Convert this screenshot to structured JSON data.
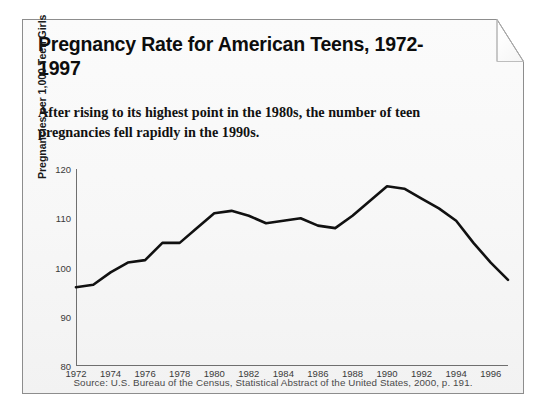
{
  "card": {
    "title": "Pregnancy Rate for American Teens, 1972-1997",
    "subtitle": "After rising to its highest point in the 1980s, the number of teen pregnancies fell rapidly in the 1990s.",
    "source": "Source: U.S. Bureau of the Census, Statistical Abstract of the United States, 2000, p. 191."
  },
  "colors": {
    "line": "#111111",
    "axis": "#6f6f6f",
    "paper": "#f7f7f7",
    "text": "#0d0d0d"
  },
  "chart_data": {
    "type": "line",
    "title": "Pregnancy Rate for American Teens, 1972-1997",
    "subtitle": "After rising to its highest point in the 1980s, the number of teen pregnancies fell rapidly in the 1990s.",
    "xlabel": "",
    "ylabel": "Pregnancies per 1,000 Teen Girls",
    "xlim": [
      1972,
      1997
    ],
    "ylim": [
      80,
      120
    ],
    "grid": false,
    "legend": null,
    "ytick_labels": [
      "80",
      "90",
      "100",
      "110",
      "120"
    ],
    "yticks": [
      80,
      90,
      100,
      110,
      120
    ],
    "xtick_labels": [
      "1972",
      "1974",
      "1976",
      "1978",
      "1980",
      "1982",
      "1984",
      "1986",
      "1988",
      "1990",
      "1992",
      "1994",
      "1996"
    ],
    "xticks": [
      1972,
      1974,
      1976,
      1978,
      1980,
      1982,
      1984,
      1986,
      1988,
      1990,
      1992,
      1994,
      1996
    ],
    "x": [
      1972,
      1973,
      1974,
      1975,
      1976,
      1977,
      1978,
      1979,
      1980,
      1981,
      1982,
      1983,
      1984,
      1985,
      1986,
      1987,
      1988,
      1989,
      1990,
      1991,
      1992,
      1993,
      1994,
      1995,
      1996,
      1997
    ],
    "series": [
      {
        "name": "Pregnancies per 1,000 Teen Girls",
        "values": [
          96,
          96.5,
          99,
          101,
          101.5,
          105,
          105,
          108,
          111,
          111.5,
          110.5,
          109,
          109.5,
          110,
          108.5,
          108,
          110.5,
          113.5,
          116.5,
          116,
          114,
          112,
          109.5,
          105,
          101,
          97.5
        ]
      }
    ],
    "source": "Source: U.S. Bureau of the Census, Statistical Abstract of the United States, 2000, p. 191."
  }
}
